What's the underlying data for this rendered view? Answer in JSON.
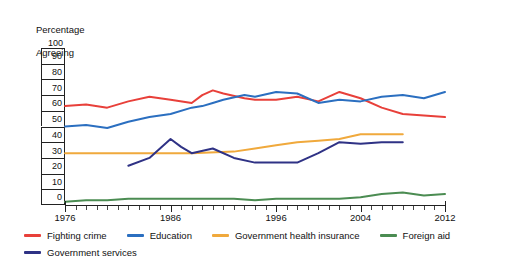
{
  "chart_data": {
    "type": "line",
    "title": "",
    "subtitle": "",
    "xlabel": "",
    "ylabel": "Percentage\nAgreeing",
    "ylim": [
      0,
      100
    ],
    "ytick_labels": [
      "100",
      "90",
      "80",
      "70",
      "60",
      "50",
      "40",
      "30",
      "20",
      "10",
      "0"
    ],
    "xlim": [
      1976,
      2012
    ],
    "xtick_labels": [
      "1976",
      "1986",
      "1996",
      "2004",
      "2012"
    ],
    "xtick_values": [
      1976,
      1986,
      1996,
      2004,
      2012
    ],
    "grid": false,
    "legend_position": "bottom-left",
    "series": [
      {
        "name": "Fighting crime",
        "color": "#e8403a",
        "x": [
          1976,
          1978,
          1980,
          1982,
          1984,
          1986,
          1988,
          1989,
          1990,
          1991,
          1993,
          1994,
          1996,
          1998,
          2000,
          2002,
          2004,
          2006,
          2008,
          2010,
          2012
        ],
        "values": [
          63,
          64,
          62,
          66,
          69,
          67,
          65,
          70,
          73,
          71,
          68,
          67,
          67,
          69,
          66,
          72,
          68,
          62,
          58,
          57,
          56
        ]
      },
      {
        "name": "Education",
        "color": "#2b6fc0",
        "x": [
          1976,
          1978,
          1980,
          1982,
          1984,
          1986,
          1988,
          1989,
          1990,
          1991,
          1993,
          1994,
          1996,
          1998,
          2000,
          2002,
          2004,
          2006,
          2008,
          2010,
          2012
        ],
        "values": [
          50,
          51,
          49,
          53,
          56,
          58,
          62,
          63,
          65,
          67,
          70,
          69,
          72,
          71,
          65,
          67,
          66,
          69,
          70,
          68,
          72
        ]
      },
      {
        "name": "Government health insurance",
        "color": "#f0a93c",
        "x": [
          1976,
          1980,
          1984,
          1988,
          1992,
          1994,
          1996,
          1998,
          2000,
          2002,
          2004,
          2006,
          2008
        ],
        "values": [
          33,
          33,
          33,
          33,
          34,
          36,
          38,
          40,
          41,
          42,
          45,
          45,
          45
        ]
      },
      {
        "name": "Foreign aid",
        "color": "#4b8c52",
        "x": [
          1976,
          1978,
          1980,
          1982,
          1984,
          1986,
          1988,
          1990,
          1992,
          1994,
          1996,
          1998,
          2000,
          2002,
          2004,
          2006,
          2008,
          2010,
          2012
        ],
        "values": [
          2,
          3,
          3,
          4,
          4,
          4,
          4,
          4,
          4,
          3,
          4,
          4,
          4,
          4,
          5,
          7,
          8,
          6,
          7
        ]
      },
      {
        "name": "Government services",
        "color": "#2f3285",
        "x": [
          1982,
          1984,
          1986,
          1987,
          1988,
          1990,
          1992,
          1994,
          1996,
          1998,
          2000,
          2002,
          2004,
          2006,
          2008
        ],
        "values": [
          25,
          30,
          42,
          37,
          33,
          36,
          30,
          27,
          27,
          27,
          33,
          40,
          39,
          40,
          40
        ]
      }
    ]
  },
  "legend": {
    "rows": [
      [
        {
          "label": "Fighting crime",
          "color": "#e8403a"
        },
        {
          "label": "Education",
          "color": "#2b6fc0"
        },
        {
          "label": "Government health insurance",
          "color": "#f0a93c"
        },
        {
          "label": "Foreign aid",
          "color": "#4b8c52"
        }
      ],
      [
        {
          "label": "Government services",
          "color": "#2f3285"
        }
      ]
    ]
  },
  "axis": {
    "y_title_line1": "Percentage",
    "y_title_line2": "Agreeing"
  }
}
